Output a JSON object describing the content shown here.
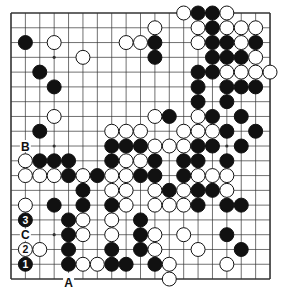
{
  "diagram": {
    "type": "go-board",
    "size": 19,
    "colors": {
      "background": "#ffffff",
      "line": "#333333",
      "black": "#111111",
      "white": "#ffffff"
    },
    "star_points_visible": [
      [
        3,
        3
      ],
      [
        3,
        9
      ],
      [
        3,
        15
      ],
      [
        15,
        9
      ]
    ],
    "stones": {
      "black": [
        [
          13,
          0
        ],
        [
          14,
          0
        ],
        [
          14,
          1
        ],
        [
          1,
          2
        ],
        [
          10,
          2
        ],
        [
          14,
          2
        ],
        [
          15,
          2
        ],
        [
          17,
          2
        ],
        [
          10,
          3
        ],
        [
          14,
          3
        ],
        [
          15,
          3
        ],
        [
          16,
          3
        ],
        [
          2,
          4
        ],
        [
          13,
          4
        ],
        [
          14,
          4
        ],
        [
          3,
          5
        ],
        [
          13,
          5
        ],
        [
          15,
          5
        ],
        [
          16,
          5
        ],
        [
          17,
          5
        ],
        [
          13,
          6
        ],
        [
          15,
          6
        ],
        [
          11,
          7
        ],
        [
          14,
          7
        ],
        [
          16,
          7
        ],
        [
          2,
          8
        ],
        [
          15,
          8
        ],
        [
          17,
          8
        ],
        [
          7,
          9
        ],
        [
          8,
          9
        ],
        [
          9,
          9
        ],
        [
          13,
          9
        ],
        [
          14,
          9
        ],
        [
          16,
          9
        ],
        [
          2,
          10
        ],
        [
          3,
          10
        ],
        [
          4,
          10
        ],
        [
          7,
          10
        ],
        [
          10,
          10
        ],
        [
          12,
          10
        ],
        [
          13,
          10
        ],
        [
          15,
          10
        ],
        [
          4,
          11
        ],
        [
          6,
          11
        ],
        [
          9,
          11
        ],
        [
          10,
          11
        ],
        [
          12,
          11
        ],
        [
          5,
          12
        ],
        [
          11,
          12
        ],
        [
          13,
          12
        ],
        [
          14,
          12
        ],
        [
          3,
          13
        ],
        [
          5,
          13
        ],
        [
          7,
          13
        ],
        [
          13,
          13
        ],
        [
          15,
          13
        ],
        [
          16,
          13
        ],
        [
          4,
          14
        ],
        [
          9,
          14
        ],
        [
          4,
          15
        ],
        [
          9,
          15
        ],
        [
          15,
          15
        ],
        [
          4,
          16
        ],
        [
          7,
          16
        ],
        [
          9,
          16
        ],
        [
          16,
          16
        ],
        [
          4,
          17
        ],
        [
          7,
          17
        ],
        [
          8,
          17
        ],
        [
          10,
          17
        ]
      ],
      "white": [
        [
          12,
          0
        ],
        [
          15,
          0
        ],
        [
          10,
          1
        ],
        [
          13,
          1
        ],
        [
          15,
          1
        ],
        [
          16,
          1
        ],
        [
          17,
          1
        ],
        [
          3,
          2
        ],
        [
          8,
          2
        ],
        [
          9,
          2
        ],
        [
          13,
          2
        ],
        [
          16,
          2
        ],
        [
          5,
          3
        ],
        [
          17,
          3
        ],
        [
          15,
          4
        ],
        [
          16,
          4
        ],
        [
          17,
          4
        ],
        [
          18,
          4
        ],
        [
          3,
          7
        ],
        [
          10,
          7
        ],
        [
          13,
          7
        ],
        [
          7,
          8
        ],
        [
          8,
          8
        ],
        [
          9,
          8
        ],
        [
          12,
          8
        ],
        [
          13,
          8
        ],
        [
          14,
          8
        ],
        [
          10,
          9
        ],
        [
          11,
          9
        ],
        [
          12,
          9
        ],
        [
          1,
          10
        ],
        [
          8,
          10
        ],
        [
          9,
          10
        ],
        [
          1,
          11
        ],
        [
          2,
          11
        ],
        [
          3,
          11
        ],
        [
          5,
          11
        ],
        [
          7,
          11
        ],
        [
          8,
          11
        ],
        [
          13,
          11
        ],
        [
          14,
          11
        ],
        [
          15,
          11
        ],
        [
          7,
          12
        ],
        [
          8,
          12
        ],
        [
          10,
          12
        ],
        [
          12,
          12
        ],
        [
          15,
          12
        ],
        [
          1,
          13
        ],
        [
          8,
          13
        ],
        [
          10,
          13
        ],
        [
          11,
          13
        ],
        [
          12,
          13
        ],
        [
          5,
          14
        ],
        [
          7,
          14
        ],
        [
          5,
          15
        ],
        [
          7,
          15
        ],
        [
          10,
          15
        ],
        [
          12,
          15
        ],
        [
          2,
          16
        ],
        [
          10,
          16
        ],
        [
          13,
          16
        ],
        [
          5,
          17
        ],
        [
          6,
          17
        ],
        [
          11,
          17
        ],
        [
          15,
          17
        ],
        [
          11,
          18
        ]
      ]
    },
    "numbered_stones": [
      {
        "label": "1",
        "color": "black",
        "point": [
          1,
          17
        ]
      },
      {
        "label": "2",
        "color": "white",
        "point": [
          1,
          16
        ]
      },
      {
        "label": "3",
        "color": "black",
        "point": [
          1,
          14
        ]
      }
    ],
    "letter_labels": [
      {
        "label": "A",
        "point": [
          4,
          18
        ]
      },
      {
        "label": "B",
        "point": [
          1,
          9
        ]
      },
      {
        "label": "C",
        "point": [
          1,
          15
        ]
      }
    ]
  }
}
